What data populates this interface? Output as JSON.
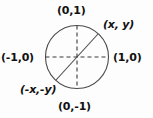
{
  "diagram": {
    "background_color": "#fdfdfd",
    "stroke_color": "#444444",
    "text_color": "#111111",
    "labels": {
      "top": "(0,1)",
      "bottom": "(0,-1)",
      "left": "(-1,0)",
      "right": "(1,0)",
      "point": "(x, y)",
      "antipode": "(-x,-y)"
    },
    "geometry": {
      "center_x": 77,
      "center_y": 57,
      "radius": 32,
      "point_x": 98,
      "point_y": 34,
      "antipode_x": 56,
      "antipode_y": 80
    }
  }
}
